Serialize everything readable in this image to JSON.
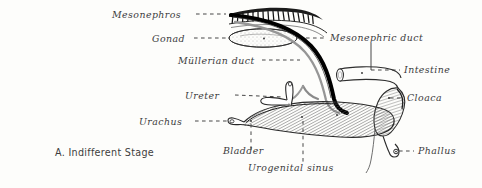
{
  "figure": {
    "caption": "A. Indifferent Stage",
    "ink_color": "#2a2a2a",
    "duct_color": "#000000",
    "mullerian_color": "#8d8d8d",
    "background_color": "#fdfdfb",
    "label_color": "#3b3b3b"
  },
  "labels": {
    "mesonephros": "Mesonephros",
    "gonad": "Gonad",
    "mullerian_duct": "Müllerian duct",
    "ureter": "Ureter",
    "urachus": "Urachus",
    "bladder": "Bladder",
    "urogenital_sinus": "Urogenital sinus",
    "mesonephric_duct": "Mesonephric duct",
    "intestine": "Intestine",
    "cloaca": "Cloaca",
    "phallus": "Phallus"
  }
}
